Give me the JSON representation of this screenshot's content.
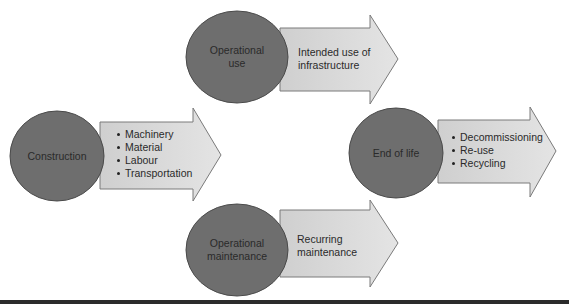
{
  "diagram": {
    "nodes": [
      {
        "id": "construction",
        "label": "Construction",
        "arrow_items": [
          "Machinery",
          "Material",
          "Labour",
          "Transportation"
        ]
      },
      {
        "id": "operational-use",
        "label_lines": [
          "Operational",
          "use"
        ],
        "arrow_text_lines": [
          "Intended use of",
          "infrastructure"
        ]
      },
      {
        "id": "end-of-life",
        "label": "End of life",
        "arrow_items": [
          "Decommissioning",
          "Re-use",
          "Recycling"
        ]
      },
      {
        "id": "operational-maintenance",
        "label_lines": [
          "Operational",
          "maintenance"
        ],
        "arrow_text_lines": [
          "Recurring",
          "maintenance"
        ]
      }
    ],
    "colors": {
      "circle_fill": "#6e6e6e",
      "circle_stroke": "#4a4a4a",
      "arrow_fill": "#dcdcdc",
      "arrow_stroke": "#7a7a7a",
      "text": "#2a2a2a"
    }
  }
}
